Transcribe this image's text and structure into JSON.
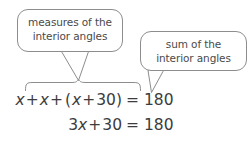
{
  "figure": {
    "background_color": "#ffffff",
    "line_color": "#8d8d8d",
    "text_color": "#4a4a4a",
    "equation_color": "#3c3c3c"
  },
  "callouts": [
    {
      "id": "measures",
      "line1": "measures of the",
      "line2": "interior angles",
      "pointer": "v-shaped-pointer-down"
    },
    {
      "id": "sum",
      "line1": "sum of the",
      "line2": "interior angles",
      "pointer": "triangular-tail-down-left"
    }
  ],
  "brace": {
    "type": "curly-brace-over-expression",
    "label": "x + x + (x + 30)"
  },
  "equations": [
    {
      "id": "equation-1",
      "full": "x + x + (x + 30) = 180",
      "lhs_tokens": [
        {
          "text": "x",
          "italic": true
        },
        {
          "text": "+",
          "italic": false
        },
        {
          "text": "x",
          "italic": true
        },
        {
          "text": "+",
          "italic": false
        },
        {
          "text": "(",
          "italic": false
        },
        {
          "text": "x",
          "italic": true
        },
        {
          "text": "+",
          "italic": false
        },
        {
          "text": "30",
          "italic": false
        },
        {
          "text": ")",
          "italic": false
        }
      ],
      "rhs": "= 180"
    },
    {
      "id": "equation-2",
      "full": "3x + 30 = 180",
      "lhs_tokens": [
        {
          "text": "3",
          "italic": false
        },
        {
          "text": "x",
          "italic": true
        },
        {
          "text": "+",
          "italic": false
        },
        {
          "text": "30",
          "italic": false
        }
      ],
      "rhs": "= 180"
    }
  ]
}
